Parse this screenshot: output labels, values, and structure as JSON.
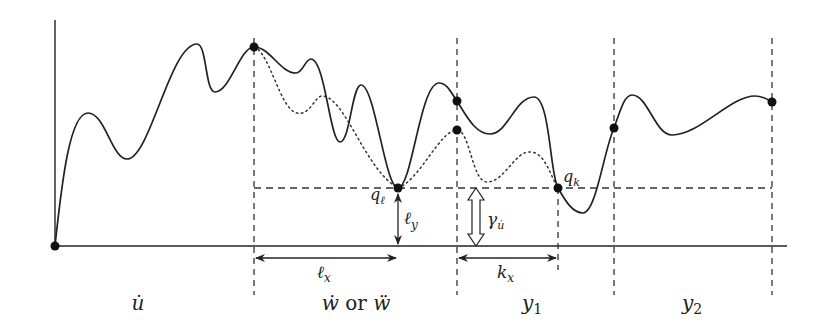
{
  "diagram": {
    "type": "function-curve-segments",
    "colors": {
      "stroke": "#222222",
      "background": "#ffffff"
    },
    "points": {
      "q_l": {
        "label": "q",
        "subscript": "ℓ",
        "x": 398,
        "y": 188
      },
      "q_k": {
        "label": "q",
        "subscript": "k",
        "x": 558,
        "y": 188
      }
    },
    "measurements": {
      "l_y": {
        "label": "ℓ",
        "subscript": "y"
      },
      "l_x": {
        "label": "ℓ",
        "subscript": "x"
      },
      "k_x": {
        "label": "k",
        "subscript": "x"
      },
      "gamma": {
        "label": "γ",
        "subscript": "u̇"
      }
    },
    "segments": [
      {
        "label": "u̇"
      },
      {
        "label": "ẇ or ẅ",
        "parts": [
          "ẇ",
          " or ",
          "ẅ"
        ]
      },
      {
        "label": "y₁",
        "base": "y",
        "sub": "1"
      },
      {
        "label": "y₂",
        "base": "y",
        "sub": "2"
      }
    ]
  }
}
